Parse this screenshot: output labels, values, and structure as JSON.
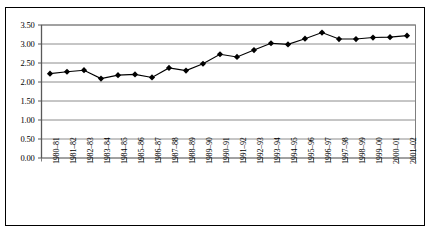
{
  "chart_data": {
    "type": "line",
    "title": "",
    "subtitle": "",
    "xlabel": "",
    "ylabel": "",
    "legend": [],
    "legend_position": "none",
    "grid": true,
    "grid_axis": "y",
    "ylim": [
      0.0,
      3.5
    ],
    "ytick_step": 0.5,
    "ytick_labels": [
      "3.50",
      "3.00",
      "2.50",
      "2.00",
      "1.50",
      "1.00",
      "0.50",
      "0.00"
    ],
    "ytick_values": [
      3.5,
      3.0,
      2.5,
      2.0,
      1.5,
      1.0,
      0.5,
      0.0
    ],
    "categories": [
      "1980–81",
      "1981–82",
      "1982–83",
      "1983–84",
      "1984–85",
      "1985–86",
      "1986–87",
      "1987–88",
      "1988–89",
      "1989–90",
      "1990–91",
      "1991–92",
      "1992–93",
      "1993–94",
      "1994–95",
      "1995–96",
      "1996–97",
      "1997–98",
      "1998–99",
      "1999–00",
      "2000–01",
      "2001–02"
    ],
    "values": [
      2.22,
      2.27,
      2.31,
      2.09,
      2.18,
      2.2,
      2.12,
      2.37,
      2.3,
      2.48,
      2.73,
      2.66,
      2.84,
      3.02,
      2.99,
      3.14,
      3.3,
      3.13,
      3.13,
      3.17,
      3.18,
      3.22
    ],
    "marker": "diamond",
    "marker_color": "#000000",
    "line_color": "#000000",
    "gridline_color": "#808080",
    "axis_color": "#7f7f7f",
    "plot_background": "#ffffff",
    "border_color": "#000000"
  }
}
